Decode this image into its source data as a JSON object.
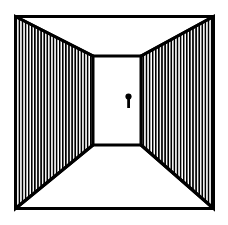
{
  "illustration": {
    "title": "Perspective corridor with keyhole door",
    "background_color": "#ffffff",
    "ink_color": "#000000",
    "canvas": {
      "width": 228,
      "height": 225
    },
    "frame": {
      "name": "outer-frame",
      "x": 14,
      "y": 15,
      "width": 201,
      "height": 195,
      "stroke_width": 3,
      "stroke_color": "#000000",
      "fill_color": "#ffffff"
    },
    "back_wall": {
      "name": "back-wall-door",
      "x": 93,
      "y": 56,
      "width": 48,
      "height": 89,
      "stroke_width": 3,
      "stroke_color": "#000000",
      "fill_color": "#ffffff"
    },
    "left_wall": {
      "name": "left-wall",
      "points": "15.5,16.5 93,56 93,145 15.5,208.5",
      "hatch_color": "#000000",
      "hatch_background": "#ffffff",
      "hatch_period": 3.1,
      "hatch_line_width": 1.6,
      "hatch_orientation": "vertical"
    },
    "right_wall": {
      "name": "right-wall",
      "points": "141,56 213.5,16.5 213.5,208.5 141,145",
      "hatch_color": "#000000",
      "hatch_background": "#ffffff",
      "hatch_period": 3.1,
      "hatch_line_width": 1.6,
      "hatch_orientation": "vertical"
    },
    "ceiling": {
      "name": "ceiling-plane",
      "points": "15.5,16.5 213.5,16.5 141,56 93,56",
      "fill_color": "#ffffff"
    },
    "floor": {
      "name": "floor-plane",
      "points": "93,145 141,145 213.5,208.5 15.5,208.5",
      "fill_color": "#ffffff"
    },
    "keyhole": {
      "name": "keyhole",
      "circle": {
        "cx": 128.5,
        "cy": 96.5,
        "r": 3.1
      },
      "stem": {
        "x": 127.2,
        "y": 98.5,
        "width": 2.8,
        "height": 9.5
      },
      "fill_color": "#000000"
    },
    "edges": [
      {
        "name": "edge-ceiling-left",
        "x1": 15.5,
        "y1": 16.5,
        "x2": 93,
        "y2": 56
      },
      {
        "name": "edge-ceiling-right",
        "x1": 213.5,
        "y1": 16.5,
        "x2": 141,
        "y2": 56
      },
      {
        "name": "edge-floor-left",
        "x1": 15.5,
        "y1": 208.5,
        "x2": 93,
        "y2": 145
      },
      {
        "name": "edge-floor-right",
        "x1": 213.5,
        "y1": 208.5,
        "x2": 141,
        "y2": 145
      },
      {
        "name": "edge-back-wall-left",
        "x1": 93,
        "y1": 56,
        "x2": 93,
        "y2": 145
      },
      {
        "name": "edge-back-wall-right",
        "x1": 141,
        "y1": 56,
        "x2": 141,
        "y2": 145
      },
      {
        "name": "edge-back-wall-top",
        "x1": 93,
        "y1": 56,
        "x2": 141,
        "y2": 56
      },
      {
        "name": "edge-back-wall-bottom",
        "x1": 93,
        "y1": 145,
        "x2": 141,
        "y2": 145
      }
    ]
  }
}
